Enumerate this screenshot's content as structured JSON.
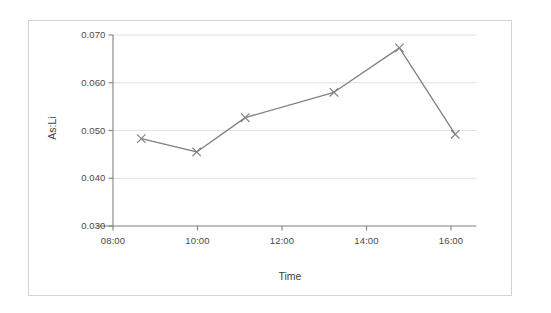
{
  "chart_data": {
    "type": "line",
    "title": "",
    "xlabel": "Time",
    "ylabel": "As:Li",
    "x_tick_labels": [
      "08:00",
      "10:00",
      "12:00",
      "14:00",
      "16:00"
    ],
    "x_tick_hours": [
      8,
      10,
      12,
      14,
      16
    ],
    "y_tick_labels": [
      "0.030",
      "0.040",
      "0.050",
      "0.060",
      "0.070"
    ],
    "y_tick_values": [
      0.03,
      0.04,
      0.05,
      0.06,
      0.07
    ],
    "ylim": [
      0.03,
      0.07
    ],
    "xlim_hours": [
      7.6,
      16.6
    ],
    "grid": "horizontal",
    "legend": "none",
    "marker": "x",
    "line_color": "#808080",
    "marker_color": "#808080",
    "grid_color": "#d9d9d9",
    "axis_color": "#808080",
    "points": [
      {
        "time": "08:40",
        "hour": 8.67,
        "value": 0.0483
      },
      {
        "time": "10:00",
        "hour": 9.98,
        "value": 0.0455
      },
      {
        "time": "11:10",
        "hour": 11.13,
        "value": 0.0527
      },
      {
        "time": "13:15",
        "hour": 13.23,
        "value": 0.058
      },
      {
        "time": "14:45",
        "hour": 14.78,
        "value": 0.0673
      },
      {
        "time": "16:06",
        "hour": 16.1,
        "value": 0.0492
      }
    ],
    "x": [
      8.67,
      9.98,
      11.13,
      13.23,
      14.78,
      16.1
    ],
    "values": [
      0.0483,
      0.0455,
      0.0527,
      0.058,
      0.0673,
      0.0492
    ]
  }
}
